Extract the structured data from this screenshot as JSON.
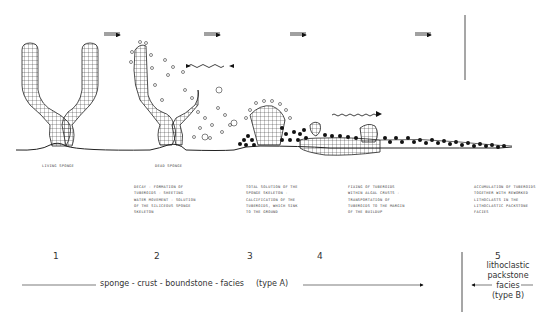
{
  "stages": [
    {
      "number": "1",
      "label": "LIVING SPONGE",
      "description": ""
    },
    {
      "number": "2",
      "label": "DEAD SPONGE",
      "description": "DECAY - FORMATION OF\nTUBEROIDS - SHEETING\nWATER MOVEMENT - SOLUTION\nOF THE SILICEOUS SPONGE\nSKELETON"
    },
    {
      "number": "3",
      "label": "",
      "description": "TOTAL SOLUTION OF THE\nSPONGE SKELETON -\nCALCIFICATION OF THE\nTUBEROIDS, WHICH SINK\nTO THE GROUND"
    },
    {
      "number": "4",
      "label": "",
      "description": "FIXING OF TUBEROIDS\nWITHIN ALGAL CRUSTS -\nTRANSPORTATION OF\nTUBEROIDS TO THE MARGIN\nOF THE BUILDUP"
    },
    {
      "number": "5",
      "label": "",
      "description": "ACCUMULATION OF TUBEROIDS\nTOGETHER WITH REWORKED\nLITHOCLASTS IN THE\nLITHOCLASTIC PACKSTONE\nFACIES"
    }
  ],
  "facies": {
    "type_a": "sponge - crust - boundstone - facies",
    "type_a_tag": "(type  A)",
    "type_b_line1": "lithoclastic",
    "type_b_line2": "packstone",
    "type_b_line3": "facies",
    "type_b_line4": "(type B)"
  }
}
